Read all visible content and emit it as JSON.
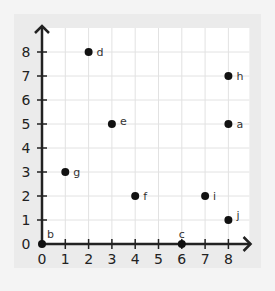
{
  "chart_data": {
    "type": "scatter",
    "title": "",
    "xlabel": "",
    "ylabel": "",
    "xlim": [
      0,
      8
    ],
    "ylim": [
      0,
      8
    ],
    "grid": true,
    "x_ticks": [
      "0",
      "1",
      "2",
      "3",
      "4",
      "5",
      "6",
      "7",
      "8"
    ],
    "y_ticks": [
      "0",
      "1",
      "2",
      "3",
      "4",
      "5",
      "6",
      "7",
      "8"
    ],
    "points": [
      {
        "label": "a",
        "x": 8,
        "y": 5
      },
      {
        "label": "b",
        "x": 0,
        "y": 0
      },
      {
        "label": "c",
        "x": 6,
        "y": 0
      },
      {
        "label": "d",
        "x": 2,
        "y": 8
      },
      {
        "label": "e",
        "x": 3,
        "y": 5
      },
      {
        "label": "f",
        "x": 4,
        "y": 2
      },
      {
        "label": "g",
        "x": 1,
        "y": 3
      },
      {
        "label": "h",
        "x": 8,
        "y": 7
      },
      {
        "label": "i",
        "x": 7,
        "y": 2
      },
      {
        "label": "j",
        "x": 8,
        "y": 1
      }
    ],
    "colors": {
      "point": "#111111",
      "axis": "#222222",
      "grid": "#e2e2e2",
      "plot_bg": "#ffffff"
    }
  }
}
